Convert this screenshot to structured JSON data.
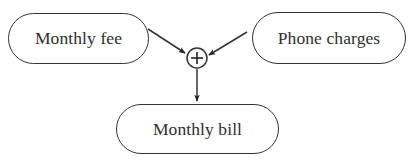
{
  "diagram": {
    "type": "flow",
    "nodes": [
      {
        "id": "monthly_fee",
        "label": "Monthly fee",
        "shape": "rounded-rect"
      },
      {
        "id": "phone_charges",
        "label": "Phone charges",
        "shape": "rounded-rect"
      },
      {
        "id": "sum",
        "label": "+",
        "shape": "circle",
        "role": "summing-junction"
      },
      {
        "id": "monthly_bill",
        "label": "Monthly bill",
        "shape": "rounded-rect"
      }
    ],
    "edges": [
      {
        "from": "monthly_fee",
        "to": "sum"
      },
      {
        "from": "phone_charges",
        "to": "sum"
      },
      {
        "from": "sum",
        "to": "monthly_bill"
      }
    ],
    "colors": {
      "stroke": "#333333",
      "text": "#2e2e2e",
      "background": "#ffffff"
    }
  }
}
